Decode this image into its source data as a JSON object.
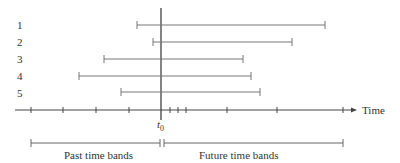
{
  "diagram": {
    "axis_label": "Time",
    "t0_label": "t",
    "t0_subscript": "0",
    "row_labels": [
      "1",
      "2",
      "3",
      "4",
      "5"
    ],
    "bands": {
      "past_label": "Past time bands",
      "future_label": "Future time bands"
    },
    "intervals": [
      {
        "row": "1",
        "start_px": 137,
        "end_px": 325
      },
      {
        "row": "2",
        "start_px": 153,
        "end_px": 292
      },
      {
        "row": "3",
        "start_px": 104,
        "end_px": 243
      },
      {
        "row": "4",
        "start_px": 79,
        "end_px": 251
      },
      {
        "row": "5",
        "start_px": 121,
        "end_px": 260
      }
    ],
    "axis_ticks_px": [
      31,
      63,
      96,
      129,
      170,
      178,
      186,
      227,
      277,
      343
    ],
    "colors": {
      "line": "#555555",
      "axis": "#333333"
    }
  }
}
